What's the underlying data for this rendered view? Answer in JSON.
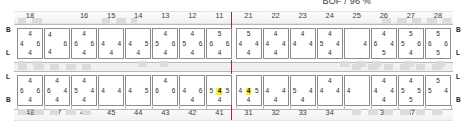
{
  "title": "BOF / 96 %",
  "colors": {
    "highlight": "#f5ee1a",
    "cell_border": "#8d8d8d",
    "divider": "#9a2f33",
    "hatch": "#dcdcdc"
  },
  "rulers": {
    "top_labels": [
      "18",
      "16",
      "15",
      "14",
      "13",
      "12",
      "11",
      "21",
      "22",
      "23",
      "24",
      "25",
      "26",
      "27",
      "28"
    ],
    "bottom_labels": [
      "48",
      "47",
      "46",
      "45",
      "44",
      "43",
      "42",
      "41",
      "31",
      "32",
      "33",
      "34",
      "35",
      "36",
      "37",
      "38"
    ]
  },
  "tier_markers": {
    "upper_left": [
      "B",
      "L"
    ],
    "upper_right": [
      "B",
      "L"
    ],
    "lower_left": [
      "L",
      "B"
    ],
    "lower_right": [
      "L",
      "B"
    ]
  },
  "upper_deck": {
    "name": "upper-deck-row",
    "cells": [
      {
        "id": "u1",
        "tc": "4",
        "ml": "4",
        "mr": "6",
        "bc": "4"
      },
      {
        "id": "u2",
        "tl": "4",
        "mr": "6",
        "bl": "4"
      },
      {
        "id": "u3",
        "tc": "4",
        "ml": "6",
        "mr": "6",
        "bc": "4"
      },
      {
        "id": "u4",
        "ml": "4",
        "mr": "4",
        "bc": "4"
      },
      {
        "id": "u5",
        "ml": "4",
        "mr": "5",
        "bc": "4"
      },
      {
        "id": "u6",
        "tc": "4",
        "ml": "5",
        "mr": "6",
        "bc": "4"
      },
      {
        "id": "u7",
        "tc": "4",
        "ml": "5",
        "mr": "6",
        "bc": "4"
      },
      {
        "id": "u8",
        "tc": "5",
        "ml": "6",
        "mr": "6",
        "bc": "4"
      },
      {
        "id": "u9",
        "tc": "5",
        "ml": "4",
        "mr": "4",
        "bc": "4"
      },
      {
        "id": "u10",
        "tc": "4",
        "ml": "4",
        "mr": "4",
        "bc": "4"
      },
      {
        "id": "u11",
        "tc": "4",
        "ml": "4",
        "mr": "4"
      },
      {
        "id": "u12",
        "tc": "4",
        "ml": "5",
        "mr": "4",
        "bc": "4"
      },
      {
        "id": "u13",
        "mr": "4"
      },
      {
        "id": "u14",
        "tc": "4",
        "ml": "6",
        "mr": "4",
        "bc": "5"
      },
      {
        "id": "u15",
        "tc": "5",
        "ml": "5",
        "mr": "6",
        "bc": "4"
      },
      {
        "id": "u16",
        "tc": "5",
        "ml": "6",
        "mr": "6",
        "bc": "5"
      }
    ]
  },
  "lower_deck": {
    "name": "lower-deck-row",
    "cells": [
      {
        "id": "l1",
        "tc": "4",
        "ml": "6",
        "mr": "6",
        "bc": "4"
      },
      {
        "id": "l2",
        "tc": "4",
        "ml": "6",
        "mr": "4",
        "bc": "4"
      },
      {
        "id": "l3",
        "tc": "4",
        "ml": "5",
        "mr": "4",
        "bc": "4"
      },
      {
        "id": "l4",
        "ml": "4",
        "mr": "4"
      },
      {
        "id": "l5",
        "ml": "4",
        "mr": "5"
      },
      {
        "id": "l6",
        "tc": "4",
        "ml": "6",
        "mr": "6"
      },
      {
        "id": "l7",
        "ml": "4",
        "mr": "6",
        "bc": "4"
      },
      {
        "id": "l8",
        "ml": "5",
        "mc": "4",
        "mr": "5",
        "bc": "4",
        "highlight": "mc"
      },
      {
        "id": "l9",
        "ml": "4",
        "mc": "4",
        "mr": "5",
        "bc": "4",
        "highlight": "mc"
      },
      {
        "id": "l10",
        "ml": "4",
        "mr": "4",
        "bc": "4"
      },
      {
        "id": "l11",
        "ml": "5",
        "mr": "4",
        "bc": "4"
      },
      {
        "id": "l12",
        "tc": "4",
        "ml": "4",
        "mr": "4"
      },
      {
        "id": "l13",
        "ml": "4"
      },
      {
        "id": "l14",
        "tc": "4",
        "ml": "4",
        "mr": "4",
        "bc": "4"
      },
      {
        "id": "l15",
        "tc": "4",
        "ml": "5",
        "mr": "5",
        "bc": "5"
      },
      {
        "id": "l16",
        "tc": "5",
        "ml": "5",
        "mr": "4"
      }
    ]
  }
}
